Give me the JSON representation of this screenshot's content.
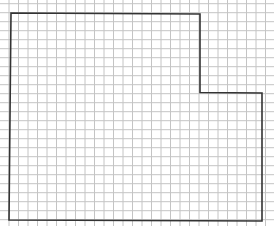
{
  "diagram": {
    "type": "floor-plan-outline-on-graph-paper",
    "background_color": "#ffffff",
    "grid": {
      "color": "#c4c4c4",
      "x_start": 9,
      "x_step": 9.5,
      "y_start": 3.7,
      "y_step": 9,
      "width": 274,
      "height": 226
    },
    "outline": {
      "color": "#333333",
      "stroke_width": 1.6,
      "points": [
        [
          11,
          13
        ],
        [
          200,
          14
        ],
        [
          200,
          92.5
        ],
        [
          262,
          93
        ],
        [
          262,
          221
        ],
        [
          9,
          220
        ]
      ]
    }
  }
}
